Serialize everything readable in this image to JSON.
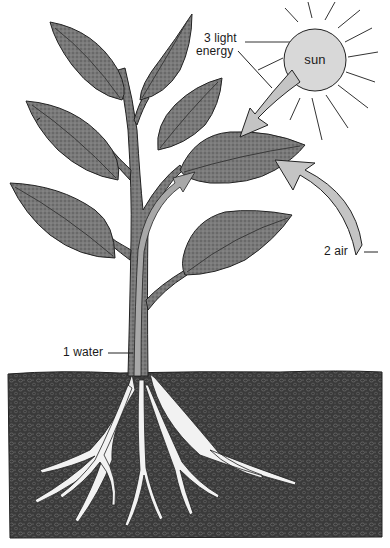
{
  "diagram": {
    "type": "plant photosynthesis illustration",
    "colors": {
      "background": "#ffffff",
      "leaf_fill": "#6e6e6e",
      "leaf_vein": "#3a3a3a",
      "stem_fill": "#7a7a7a",
      "xylem": "#a8a8a8",
      "soil": "#3c3c3c",
      "root": "#f2f2f2",
      "sun_fill": "#d8d8d8",
      "arrow_fill": "#c4c4c4",
      "outline": "#222222"
    },
    "labels": {
      "water": "1 water",
      "air": "2 air",
      "light_line1": "3 light",
      "light_line2": "energy",
      "sun": "sun"
    },
    "elements": [
      {
        "name": "sun",
        "label": "sun"
      },
      {
        "name": "light-energy-arrow",
        "label": "3 light energy"
      },
      {
        "name": "air-arrow",
        "label": "2 air"
      },
      {
        "name": "water-path-arrow",
        "label": "1 water"
      },
      {
        "name": "plant-stem"
      },
      {
        "name": "leaves",
        "count": 8
      },
      {
        "name": "roots"
      },
      {
        "name": "soil"
      }
    ]
  }
}
